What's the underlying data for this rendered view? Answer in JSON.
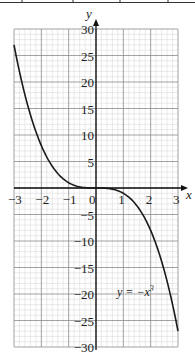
{
  "chart_data": {
    "type": "line",
    "title": "",
    "xlabel": "x",
    "ylabel": "y",
    "xlim": [
      -3,
      3
    ],
    "ylim": [
      -30,
      30
    ],
    "grid": true,
    "x_ticks": [
      -3,
      -2,
      -1,
      0,
      1,
      2,
      3
    ],
    "x_tick_labels": [
      "−3",
      "−2",
      "−1",
      "0",
      "1",
      "2",
      "3"
    ],
    "y_ticks": [
      30,
      25,
      20,
      15,
      10,
      5,
      -5,
      -10,
      -15,
      -20,
      -25,
      -30
    ],
    "y_tick_labels": [
      "30",
      "25",
      "20",
      "15",
      "10",
      "5",
      "−5",
      "−10",
      "−15",
      "−20",
      "−25",
      "−30"
    ],
    "series": [
      {
        "name": "y = −x³",
        "x": [
          -3,
          -2.5,
          -2,
          -1.5,
          -1,
          -0.5,
          0,
          0.5,
          1,
          1.5,
          2,
          2.5,
          3
        ],
        "values": [
          27,
          15.625,
          8,
          3.375,
          1,
          0.125,
          0,
          -0.125,
          -1,
          -3.375,
          -8,
          -15.625,
          -27
        ]
      }
    ],
    "annotations": [
      {
        "text": "y = −x³",
        "x": 1.5,
        "y": -20
      }
    ],
    "legend": "none"
  },
  "labels": {
    "x_axis": "x",
    "y_axis": "y",
    "equation_main": "y = −x",
    "equation_exp": "3"
  },
  "colors": {
    "curve": "#1a1a1a",
    "major_grid": "#8a8a8a",
    "minor_grid": "#d4d4d4"
  }
}
